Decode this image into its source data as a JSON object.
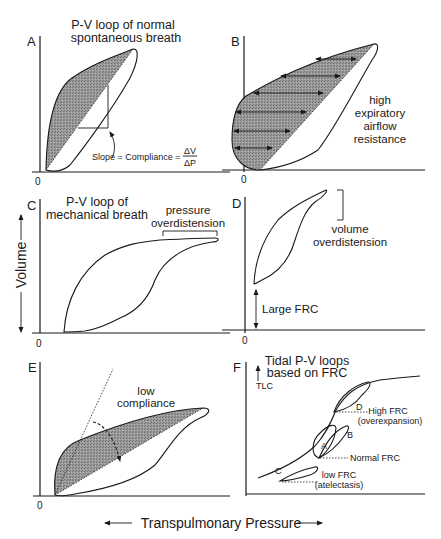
{
  "figure": {
    "axis_labels": {
      "x": "Transpulmonary Pressure",
      "y": "Volume"
    },
    "zero_label": "0",
    "colors": {
      "ink": "#1a1a1a",
      "shade": "#8a8a8a",
      "background": "#ffffff"
    },
    "panels": {
      "A": {
        "letter": "A",
        "title_line1": "P-V loop of normal",
        "title_line2": "spontaneous breath",
        "slope_label": "Slope = Compliance =",
        "frac_num": "ΔV",
        "frac_den": "ΔP"
      },
      "B": {
        "letter": "B",
        "note_line1": "high",
        "note_line2": "expiratory",
        "note_line3": "airflow",
        "note_line4": "resistance"
      },
      "C": {
        "letter": "C",
        "title_line1": "P-V loop of",
        "title_line2": "mechanical breath",
        "note_line1": "pressure",
        "note_line2": "overdistension"
      },
      "D": {
        "letter": "D",
        "note_line1": "volume",
        "note_line2": "overdistension",
        "frc_label": "Large FRC"
      },
      "E": {
        "letter": "E",
        "note_line1": "low",
        "note_line2": "compliance"
      },
      "F": {
        "letter": "F",
        "title_line1": "Tidal P-V loops",
        "title_line2": "based on FRC",
        "tlc_label": "TLC",
        "loop_labels": [
          "A",
          "B",
          "C",
          "D"
        ],
        "high_frc_line1": "High FRC",
        "high_frc_line2": "(overexpansion)",
        "normal_frc": "Normal FRC",
        "low_frc_line1": "low FRC",
        "low_frc_line2": "(atelectasis)"
      }
    }
  }
}
